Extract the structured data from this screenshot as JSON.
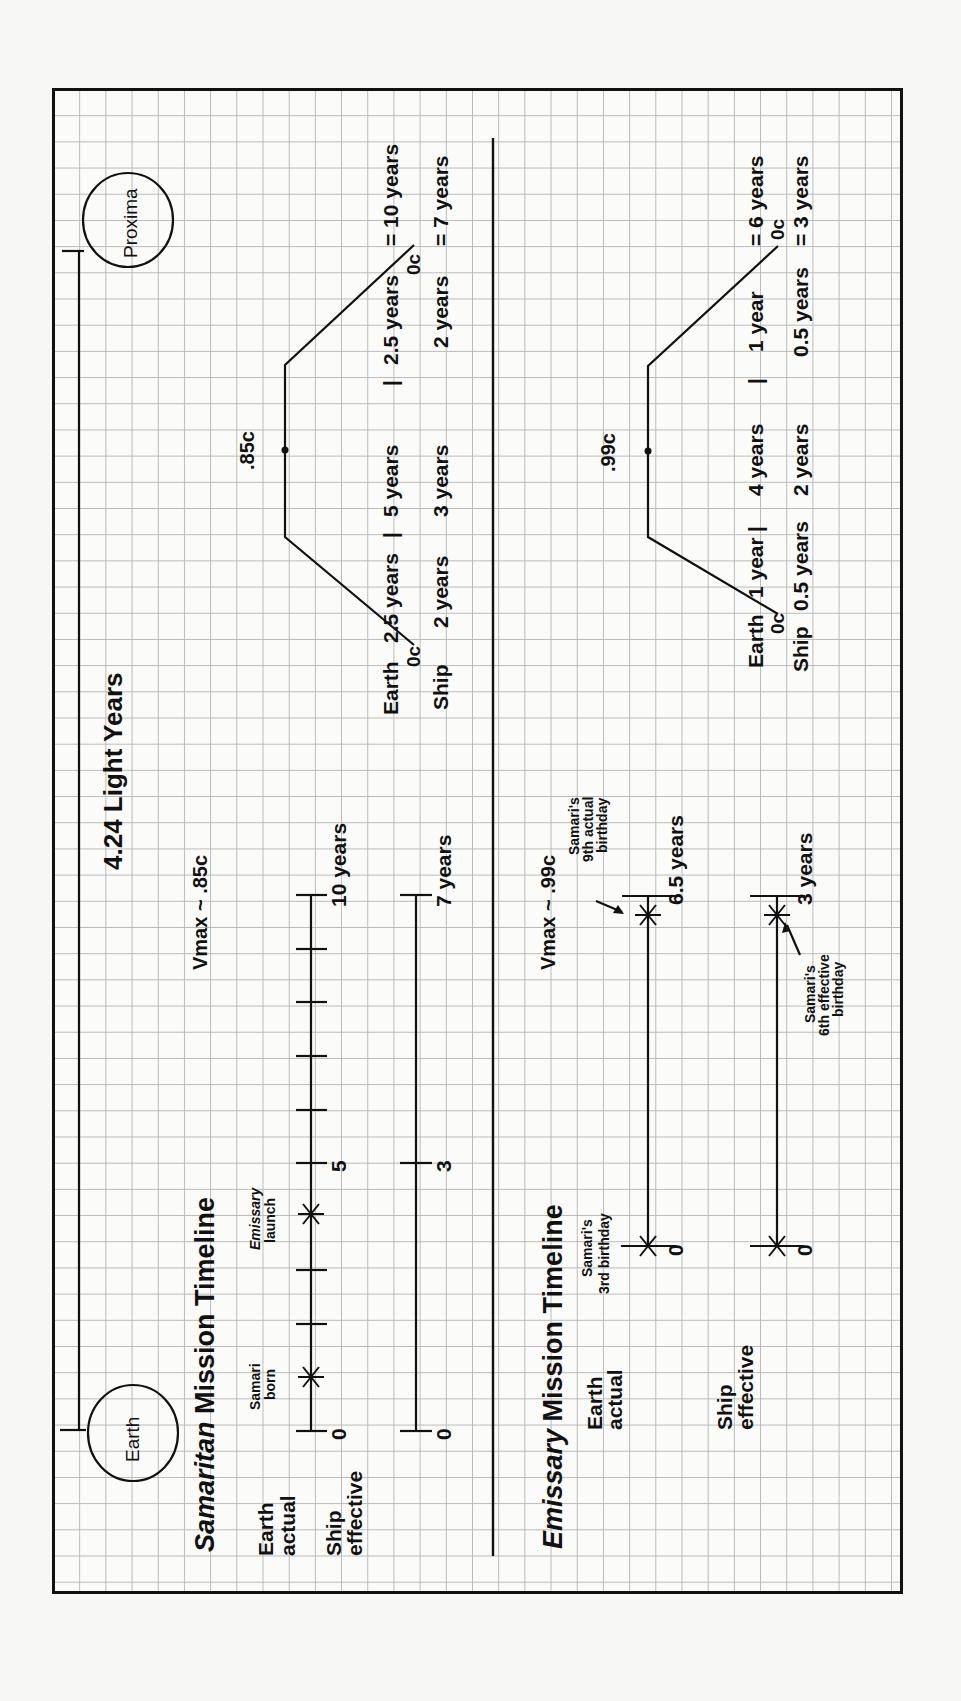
{
  "title": "4.24 Light Years",
  "endpoints": {
    "origin": "Earth",
    "destination": "Proxima"
  },
  "colors": {
    "ink": "#111111",
    "grid": "#b9b9b9",
    "paper": "#fbfbf9"
  },
  "samaritan": {
    "heading_italic": "Samaritan",
    "heading_rest": " Mission Timeline",
    "vmax": "Vmax ~ .85c",
    "earth_label": [
      "Earth",
      "actual"
    ],
    "ship_label": [
      "Ship",
      "effective"
    ],
    "earth_axis": {
      "start": "0",
      "mid": "5",
      "end": "10 years",
      "ticks": [
        0,
        1,
        2,
        3,
        4,
        5,
        6,
        7,
        8,
        9,
        10
      ]
    },
    "ship_axis": {
      "start": "0",
      "mid": "3",
      "end": "7 years"
    },
    "events": [
      {
        "label_line1": "Samari",
        "label_line2": "born",
        "year": 1
      },
      {
        "label_line1": "Emissary",
        "label_line2": "launch",
        "year": 4
      }
    ],
    "profile": {
      "peak": ".85c",
      "start_speed": "0c",
      "end_speed": "0c",
      "earth_row": {
        "label": "Earth",
        "accel": "2.5 years",
        "sep1": "|",
        "cruise": "5 years",
        "sep2": "|",
        "decel": "2.5 years",
        "total": "= 10 years"
      },
      "ship_row": {
        "label": "Ship",
        "accel": "2 years",
        "cruise": "3 years",
        "decel": "2 years",
        "total": "= 7 years"
      }
    }
  },
  "emissary": {
    "heading_italic": "Emissary",
    "heading_rest": " Mission Timeline",
    "vmax": "Vmax ~ .99c",
    "earth_label": [
      "Earth",
      "actual"
    ],
    "ship_label": [
      "Ship",
      "effective"
    ],
    "earth_axis": {
      "start": "0",
      "end": "6.5 years"
    },
    "ship_axis": {
      "start": "0",
      "end": "3 years"
    },
    "annotations": {
      "start": [
        "Samari's",
        "3rd birthday"
      ],
      "earth_end": [
        "Samari's",
        "9th actual",
        "birthday"
      ],
      "ship_end": [
        "Samari's",
        "6th effective",
        "birthday"
      ]
    },
    "profile": {
      "peak": ".99c",
      "start_speed": "0c",
      "end_speed": "0c",
      "earth_row": {
        "label": "Earth",
        "accel": "1 year",
        "sep1": "|",
        "cruise": "4 years",
        "sep2": "|",
        "decel": "1 year",
        "total": "= 6 years"
      },
      "ship_row": {
        "label": "Ship",
        "accel": "0.5 years",
        "cruise": "2 years",
        "decel": "0.5 years",
        "total": "= 3 years"
      }
    }
  }
}
